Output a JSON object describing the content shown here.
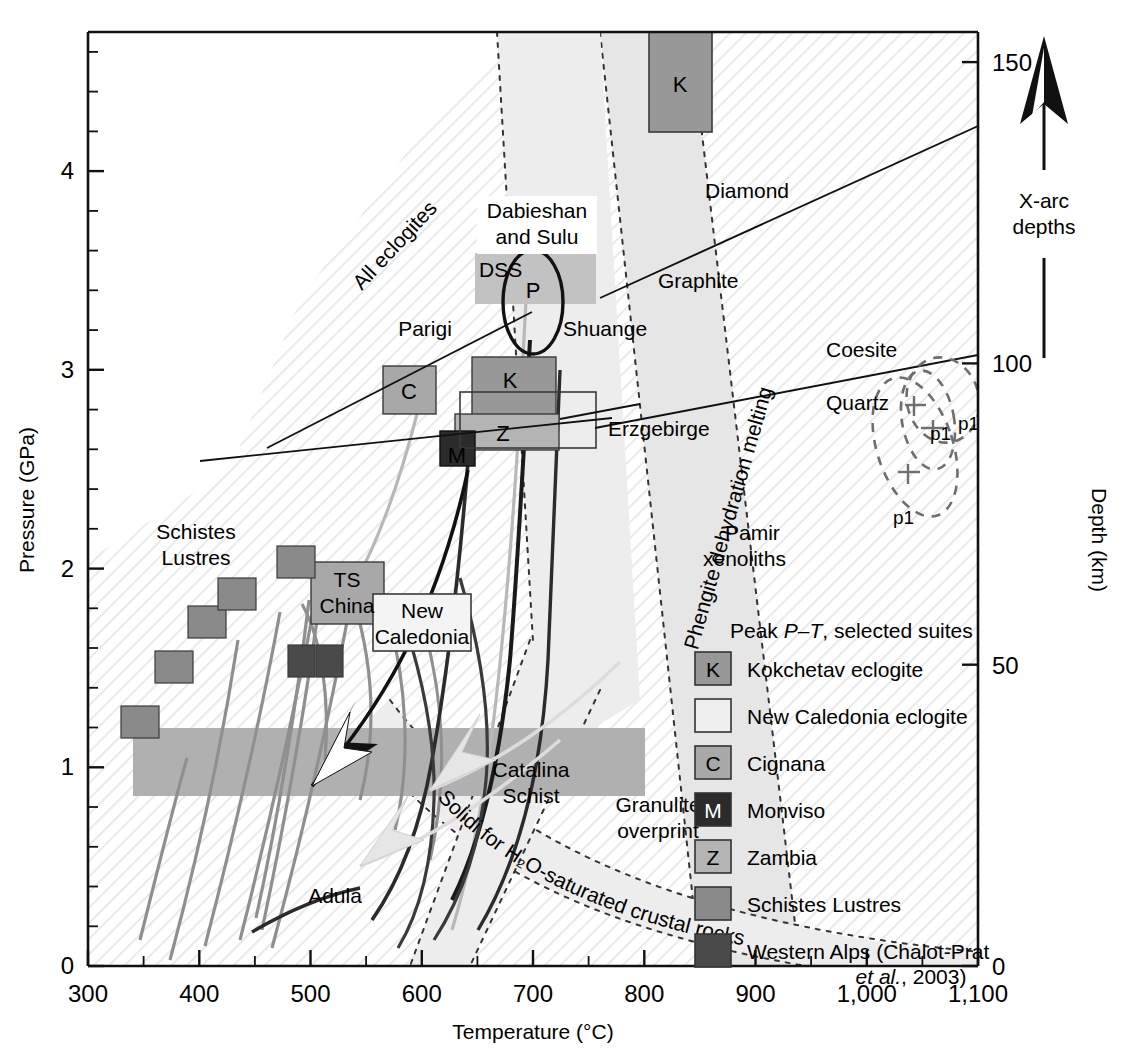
{
  "figure": {
    "type": "scatter",
    "title": "",
    "xlabel": "Temperature (°C)",
    "ylabel": "Pressure (GPa)",
    "y2label": "Depth (km)"
  },
  "axes": {
    "x": {
      "label": "Temperature (°C)",
      "min": 300,
      "max": 1100,
      "major_ticks": [
        300,
        400,
        500,
        600,
        700,
        800,
        900,
        1000,
        1100
      ],
      "tick_labels": [
        "300",
        "400",
        "500",
        "600",
        "700",
        "800",
        "900",
        "1,000",
        "1,100"
      ],
      "minor_step": 50
    },
    "y_left": {
      "label": "Pressure (GPa)",
      "min": 0,
      "max": 4.7,
      "major_ticks": [
        0,
        1,
        2,
        3,
        4
      ],
      "tick_labels": [
        "0",
        "1",
        "2",
        "3",
        "4"
      ],
      "minor_step": 0.2
    },
    "y_right": {
      "label": "Depth (km)",
      "min": 0,
      "max": 155,
      "major_ticks": [
        0,
        50,
        100,
        150
      ],
      "tick_labels": [
        "0",
        "50",
        "100",
        "150"
      ]
    }
  },
  "annotations": {
    "all_eclogites": "All eclogites",
    "dabieshan_and_sulu": "Dabieshan\nand Sulu",
    "dabieshan_line1": "Dabieshan",
    "dabieshan_line2": "and Sulu",
    "dss": "DSS",
    "p_ellipse": "P",
    "parigi": "Parigi",
    "shuange": "Shuange",
    "erzgebirge": "Erzgebirge",
    "diamond": "Diamond",
    "graphite": "Graphite",
    "coesite": "Coesite",
    "quartz": "Quartz",
    "phengite": "Phengite dehydration melting",
    "pamir_line1": "Pamir",
    "pamir_line2": "xenoliths",
    "schistes_line1": "Schistes",
    "schistes_line2": "Lustres",
    "ts_line1": "TS",
    "ts_line2": "China",
    "newcal_line1": "New",
    "newcal_line2": "Caledonia",
    "catalina_line1": "Catalina",
    "catalina_line2": "Schist",
    "granulite_line1": "Granulite",
    "granulite_line2": "overprint",
    "adula": "Adula",
    "solidi": "Solidi for H₂O-saturated crustal rocks",
    "xarc_line1": "X-arc",
    "xarc_line2": "depths",
    "p1": "p1",
    "box_K": "K",
    "box_C": "C",
    "box_M": "M",
    "box_Z": "Z"
  },
  "legend": {
    "title_prefix": "Peak ",
    "title_italic": "P–T",
    "title_suffix": ", selected suites",
    "title_full": "Peak P–T, selected suites",
    "items": [
      {
        "symbol": "K",
        "label": "Kokchetav eclogite",
        "color": "#989898"
      },
      {
        "symbol": "",
        "label": "New Caledonia eclogite",
        "color": "#efefef"
      },
      {
        "symbol": "C",
        "label": "Cignana",
        "color": "#a8a8a8"
      },
      {
        "symbol": "M",
        "label": "Monviso",
        "color": "#2b2b2b"
      },
      {
        "symbol": "Z",
        "label": "Zambia",
        "color": "#b4b4b4"
      },
      {
        "symbol": "",
        "label": "Schistes Lustres",
        "color": "#8a8a8a"
      },
      {
        "symbol": "",
        "label": "Western Alps (Chalot-Prat",
        "label2": "et al., 2003)",
        "color": "#4a4a4a"
      }
    ]
  },
  "chart_data": {
    "type": "scatter",
    "xlabel": "Temperature (°C)",
    "ylabel": "Pressure (GPa)",
    "y2label": "Depth (km)",
    "xlim": [
      300,
      1100
    ],
    "ylim": [
      0,
      4.7
    ],
    "y2lim": [
      0,
      155
    ],
    "grid": false,
    "legend_position": "lower-right-inside",
    "peak_pt_boxes": [
      {
        "name": "Kokchetav eclogite (upper)",
        "symbol": "K",
        "T_range": [
          660,
          715
        ],
        "P_range": [
          4.15,
          4.72
        ],
        "color": "#989898"
      },
      {
        "name": "Dabieshan and Sulu (DSS)",
        "symbol": "DSS",
        "T_range": [
          637,
          745
        ],
        "P_range": [
          3.23,
          3.62
        ],
        "color": "#c2c2c2"
      },
      {
        "name": "Kokchetav eclogite (lower)",
        "symbol": "K",
        "T_range": [
          663,
          737
        ],
        "P_range": [
          2.73,
          3.12
        ],
        "color": "#989898"
      },
      {
        "name": "Cignana",
        "symbol": "C",
        "T_range": [
          545,
          592
        ],
        "P_range": [
          2.7,
          3.02
        ],
        "color": "#a8a8a8"
      },
      {
        "name": "Zambia",
        "symbol": "Z",
        "T_range": [
          636,
          727
        ],
        "P_range": [
          2.56,
          2.82
        ],
        "color": "#b4b4b4"
      },
      {
        "name": "Monviso",
        "symbol": "M",
        "T_range": [
          615,
          645
        ],
        "P_range": [
          2.47,
          2.72
        ],
        "color": "#2b2b2b"
      },
      {
        "name": "Erzgebirge",
        "symbol": "",
        "T_range": [
          620,
          740
        ],
        "P_range": [
          2.58,
          2.9
        ],
        "color": "#ffffff"
      },
      {
        "name": "TS China",
        "symbol": "TS China",
        "T_range": [
          508,
          573
        ],
        "P_range": [
          1.82,
          2.16
        ],
        "color": "#a8a8a8"
      },
      {
        "name": "New Caledonia eclogite",
        "symbol": "",
        "T_range": [
          565,
          645
        ],
        "P_range": [
          1.64,
          1.93
        ],
        "color": "#f2f2f2"
      },
      {
        "name": "Catalina Schist",
        "symbol": "",
        "T_range": [
          305,
          760
        ],
        "P_range": [
          0.77,
          1.11
        ],
        "color": "#b0b0b0"
      }
    ],
    "schistes_lustres_boxes": [
      {
        "T_range": [
          328,
          362
        ],
        "P_range": [
          1.12,
          1.26
        ]
      },
      {
        "T_range": [
          358,
          392
        ],
        "P_range": [
          1.4,
          1.55
        ]
      },
      {
        "T_range": [
          388,
          424
        ],
        "P_range": [
          1.63,
          1.79
        ]
      },
      {
        "T_range": [
          415,
          449
        ],
        "P_range": [
          1.77,
          1.93
        ]
      },
      {
        "T_range": [
          468,
          503
        ],
        "P_range": [
          1.93,
          2.11
        ]
      }
    ],
    "western_alps_boxes": [
      {
        "T_range": [
          484,
          512
        ],
        "P_range": [
          1.43,
          1.59
        ]
      },
      {
        "T_range": [
          505,
          533
        ],
        "P_range": [
          1.43,
          1.59
        ]
      }
    ],
    "reaction_lines": [
      {
        "name": "Graphite–Diamond",
        "points": [
          [
            612,
            3.31
          ],
          [
            1100,
            4.35
          ]
        ],
        "style": "solid"
      },
      {
        "name": "Quartz–Coesite",
        "points": [
          [
            603,
            2.73
          ],
          [
            1100,
            3.06
          ]
        ],
        "style": "solid"
      },
      {
        "name": "Parigi geotherm",
        "points": [
          [
            443,
            2.72
          ],
          [
            700,
            3.43
          ]
        ],
        "style": "solid"
      },
      {
        "name": "Erzgebirge tie",
        "points": [
          [
            360,
            2.58
          ],
          [
            740,
            2.79
          ]
        ],
        "style": "solid"
      }
    ],
    "bands": [
      {
        "name": "All eclogites",
        "fill": "hatched",
        "note": "broad diagonal hatched field over most of plot"
      },
      {
        "name": "Phengite dehydration melting",
        "fill": "light-gray dotted-edge band",
        "T_at_P0": [
          760,
          830
        ],
        "T_at_Pmax": [
          600,
          680
        ]
      },
      {
        "name": "Solidi for H2O-saturated crustal rocks",
        "fill": "light-gray dotted-edge band",
        "note": "curves from upper-left down to lower-right"
      },
      {
        "name": "Granulite overprint band",
        "fill": "light-gray dotted-edge band"
      }
    ],
    "pamir_xenoliths": [
      {
        "label": "p1",
        "center_T": 1035,
        "center_P": 2.78
      },
      {
        "label": "p1",
        "center_T": 1062,
        "center_P": 2.72
      },
      {
        "label": "p1",
        "center_T": 1005,
        "center_P": 2.3
      }
    ],
    "arrows": [
      {
        "name": "dark exhumation arrow",
        "from": [
          680,
          2.55
        ],
        "to": [
          470,
          0.92
        ]
      },
      {
        "name": "light exhumation arrow A",
        "from": [
          790,
          1.55
        ],
        "to": [
          610,
          0.74
        ]
      },
      {
        "name": "light exhumation arrow B",
        "from": [
          700,
          1.2
        ],
        "to": [
          540,
          0.5
        ]
      }
    ],
    "xarc_arrow": {
      "label": "X-arc depths",
      "direction": "up"
    }
  }
}
